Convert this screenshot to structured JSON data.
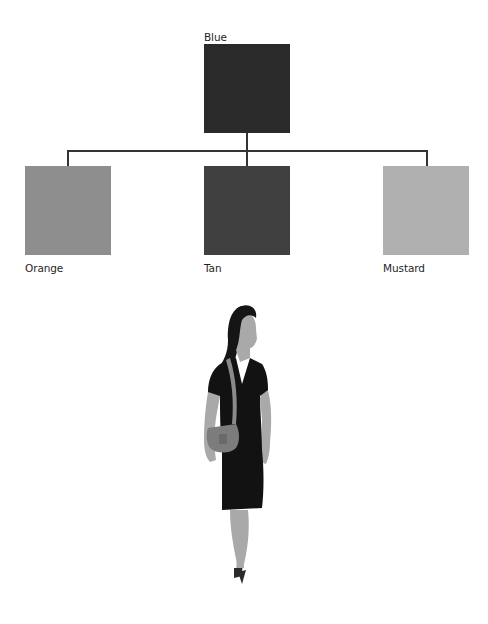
{
  "diagram": {
    "type": "tree",
    "root": {
      "label": "Blue",
      "color": "#2a2a2a"
    },
    "children": [
      {
        "label": "Orange",
        "color": "#8e8e8e"
      },
      {
        "label": "Tan",
        "color": "#404040"
      },
      {
        "label": "Mustard",
        "color": "#b0b0b0"
      }
    ],
    "connector_color": "#333333"
  },
  "illustration": {
    "subject": "woman-in-black-dress-with-crossbody-bag",
    "dress_color": "#121212",
    "skin_color": "#a9a9a9",
    "hair_color": "#151515",
    "bag_color": "#7c7c7c",
    "strap_color": "#8a8a8a",
    "shoe_color": "#2b2b2b"
  }
}
